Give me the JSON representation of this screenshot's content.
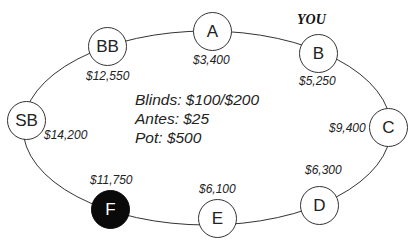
{
  "diagram": {
    "title_cut_off": "",
    "you_label": "YOU",
    "seats": [
      {
        "id": "A",
        "label": "A",
        "stack": "$3,400",
        "highlighted": false
      },
      {
        "id": "B",
        "label": "B",
        "stack": "$5,250",
        "highlighted": false,
        "is_you": true
      },
      {
        "id": "C",
        "label": "C",
        "stack": "$9,400",
        "highlighted": false
      },
      {
        "id": "D",
        "label": "D",
        "stack": "$6,300",
        "highlighted": false
      },
      {
        "id": "E",
        "label": "E",
        "stack": "$6,100",
        "highlighted": false
      },
      {
        "id": "F",
        "label": "F",
        "stack": "$11,750",
        "highlighted": true
      },
      {
        "id": "SB",
        "label": "SB",
        "stack": "$14,200",
        "highlighted": false
      },
      {
        "id": "BB",
        "label": "BB",
        "stack": "$12,550",
        "highlighted": false
      }
    ],
    "info": {
      "blinds": "Blinds: $100/$200",
      "antes": "Antes: $25",
      "pot": "Pot: $500"
    },
    "colors": {
      "line": "#333333",
      "highlight_fill": "#0a0a0a",
      "background": "#ffffff"
    }
  }
}
